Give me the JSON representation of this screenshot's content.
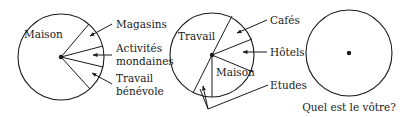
{
  "diagrams": [
    {
      "id": "pie-1",
      "center_label": "Maison",
      "labels": [
        "Magasins",
        "Activités",
        "mondaines",
        "Travail",
        "bénévole"
      ],
      "segments": [
        "Maison",
        "Magasins",
        "Activités mondaines",
        "Travail bénévole"
      ]
    },
    {
      "id": "pie-2",
      "inner_labels": [
        "Travail",
        "Maison"
      ],
      "labels": [
        "Cafés",
        "Hôtels",
        "Etudes"
      ],
      "segments": [
        "Travail",
        "Cafés",
        "Hôtels",
        "Maison",
        "Etudes"
      ]
    },
    {
      "id": "pie-3",
      "caption": "Quel est le vôtre?"
    }
  ]
}
